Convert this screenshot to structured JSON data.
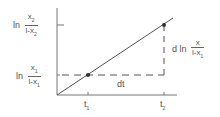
{
  "diagram": {
    "y_labels": {
      "upper": {
        "prefix": "ln",
        "num": "x",
        "num_sub": "2",
        "den": "l-x",
        "den_sub": "2"
      },
      "lower": {
        "prefix": "ln",
        "num": "x",
        "num_sub": "1",
        "den": "l-x",
        "den_sub": "1"
      }
    },
    "x_labels": {
      "t1": {
        "base": "t",
        "sub": "1"
      },
      "t2": {
        "base": "t",
        "sub": "2"
      }
    },
    "dt_label": "dt",
    "dy_label": {
      "prefix": "d ln",
      "num": "x",
      "den": "l-x",
      "den_sub": "1"
    }
  }
}
